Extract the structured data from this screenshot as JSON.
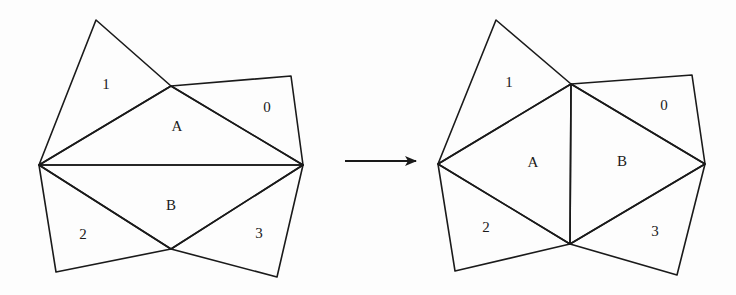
{
  "figure": {
    "before": {
      "vertices": {
        "top1": [
          96,
          20
        ],
        "mid_top": [
          171,
          86
        ],
        "top0": [
          291,
          76
        ],
        "left": [
          39,
          165
        ],
        "right": [
          303,
          165
        ],
        "mid_bottom": [
          171,
          249
        ],
        "bottom2": [
          56,
          272
        ],
        "bottom3": [
          277,
          277
        ]
      },
      "labels": [
        {
          "text": "1",
          "pos": [
            106,
            86
          ]
        },
        {
          "text": "0",
          "pos": [
            267,
            109
          ]
        },
        {
          "text": "A",
          "pos": [
            177,
            128
          ]
        },
        {
          "text": "B",
          "pos": [
            171,
            207
          ]
        },
        {
          "text": "2",
          "pos": [
            83,
            236
          ]
        },
        {
          "text": "3",
          "pos": [
            259,
            235
          ]
        }
      ]
    },
    "arrow": {
      "from": [
        345,
        161
      ],
      "to": [
        416,
        161
      ]
    },
    "after": {
      "vertices": {
        "top1": [
          496,
          20
        ],
        "mid_top": [
          571,
          84
        ],
        "top0": [
          692,
          75
        ],
        "left": [
          438,
          164
        ],
        "right": [
          705,
          164
        ],
        "mid_bottom": [
          570,
          244
        ],
        "bottom2": [
          455,
          271
        ],
        "bottom3": [
          677,
          275
        ]
      },
      "labels": [
        {
          "text": "1",
          "pos": [
            509,
            84
          ]
        },
        {
          "text": "0",
          "pos": [
            664,
            107
          ]
        },
        {
          "text": "A",
          "pos": [
            533,
            164
          ]
        },
        {
          "text": "B",
          "pos": [
            622,
            163
          ]
        },
        {
          "text": "2",
          "pos": [
            486,
            229
          ]
        },
        {
          "text": "3",
          "pos": [
            655,
            233
          ]
        }
      ]
    }
  }
}
